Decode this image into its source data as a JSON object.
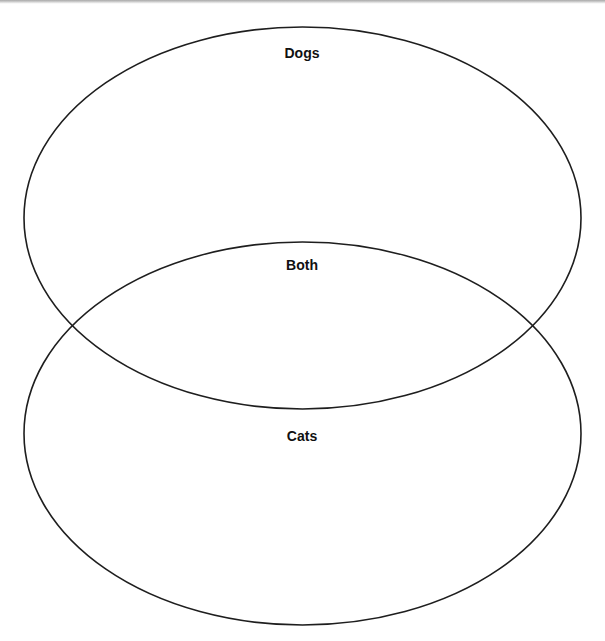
{
  "diagram": {
    "type": "venn",
    "sets": [
      {
        "id": "dogs",
        "label": "Dogs",
        "shape": {
          "cx": 302.5,
          "cy": 218,
          "rx": 278.5,
          "ry": 191
        }
      },
      {
        "id": "cats",
        "label": "Cats",
        "shape": {
          "cx": 302.5,
          "cy": 433.5,
          "rx": 278.5,
          "ry": 191.5
        }
      }
    ],
    "intersection": {
      "label": "Both"
    },
    "colors": {
      "stroke": "#1e1e1e",
      "text": "#111111",
      "background": "#ffffff"
    }
  }
}
